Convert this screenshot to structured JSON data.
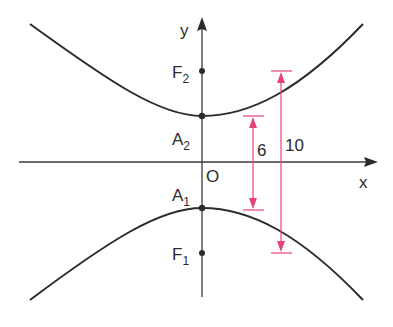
{
  "diagram": {
    "type": "hyperbola-vertical-transverse-axis",
    "colors": {
      "curve": "#2b2b2b",
      "axis": "#3a3a3a",
      "dimension": "#e8417f",
      "background": "#ffffff"
    },
    "axes": {
      "x_label": "x",
      "y_label": "y",
      "origin_label": "O"
    },
    "points": {
      "F2": {
        "label": "F",
        "sub": "2"
      },
      "A2": {
        "label": "A",
        "sub": "2"
      },
      "A1": {
        "label": "A",
        "sub": "1"
      },
      "F1": {
        "label": "F",
        "sub": "1"
      }
    },
    "dimensions": {
      "vertex_distance": "6",
      "focal_distance": "10"
    }
  }
}
